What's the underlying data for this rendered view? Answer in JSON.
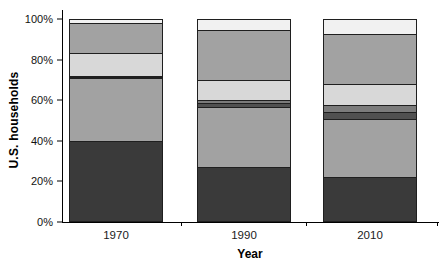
{
  "figure": {
    "background": "#ffffff",
    "bar_border_color": "#1f1f1f",
    "axis_color": "#000000"
  },
  "chart_data": {
    "type": "bar",
    "stacked": true,
    "title": "",
    "xlabel": "Year",
    "ylabel": "U.S. households",
    "categories": [
      "1970",
      "1990",
      "2010"
    ],
    "yticks": [
      "0%",
      "20%",
      "40%",
      "60%",
      "80%",
      "100%"
    ],
    "ylim": [
      0,
      100
    ],
    "grid": false,
    "legend": "none",
    "series": [
      {
        "name": "bottom-darkest-segment",
        "color": "#3a3a3a",
        "values": [
          40.0,
          27.0,
          22.0
        ]
      },
      {
        "name": "lower-medium-gray-segment",
        "color": "#a2a2a2",
        "values": [
          31.0,
          29.5,
          29.0
        ]
      },
      {
        "name": "thin-dark-stripe-segment",
        "color": "#505050",
        "values": [
          0.5,
          2.0,
          3.0
        ]
      },
      {
        "name": "thin-mid-gray-stripe-segment",
        "color": "#7b7b7b",
        "values": [
          0.5,
          1.5,
          3.5
        ]
      },
      {
        "name": "light-gray-segment",
        "color": "#d8d8d8",
        "values": [
          11.5,
          10.0,
          10.5
        ]
      },
      {
        "name": "upper-medium-gray-segment",
        "color": "#a2a2a2",
        "values": [
          15.0,
          25.0,
          25.0
        ]
      },
      {
        "name": "top-near-white-segment",
        "color": "#f1f1f1",
        "values": [
          1.5,
          5.0,
          7.0
        ]
      }
    ],
    "bar_geometry": {
      "bar_left_offsets_px": [
        6,
        134,
        260
      ],
      "bar_width_px": 94,
      "gap_tick_offsets_px": [
        118,
        243,
        374
      ]
    }
  }
}
